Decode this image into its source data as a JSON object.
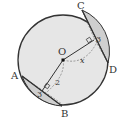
{
  "diagram": {
    "points": {
      "O": {
        "label": "O",
        "x": 63,
        "y": 60
      },
      "A": {
        "label": "A",
        "x": 22,
        "y": 76
      },
      "B": {
        "label": "B",
        "x": 62,
        "y": 106
      },
      "C": {
        "label": "C",
        "x": 82,
        "y": 10
      },
      "D": {
        "label": "D",
        "x": 108,
        "y": 63
      }
    },
    "circle": {
      "cx": 63,
      "cy": 60,
      "r": 45
    },
    "labels": {
      "dist_AB": "2",
      "dist_CD": "x",
      "half_AB": "3",
      "half_CD": "3"
    },
    "colors": {
      "circle_fill": "#e6e6e6",
      "segment_fill": "#cfcfcf",
      "stroke": "#333333",
      "dashed": "#777777"
    }
  }
}
